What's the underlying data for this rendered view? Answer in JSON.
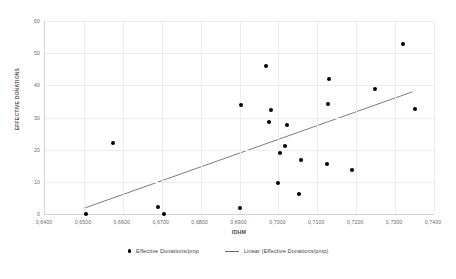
{
  "chart_data": {
    "type": "scatter",
    "title": "",
    "xlabel": "IDHM",
    "ylabel": "EFFECTIVE DONATIONS",
    "xlim": [
      0.64,
      0.74
    ],
    "ylim": [
      0,
      60
    ],
    "grid": true,
    "legend_position": "bottom",
    "x_tick_labels": [
      "0,6400",
      "0,6500",
      "0,6600",
      "0,6700",
      "0,6800",
      "0,6900",
      "0,7000",
      "0,7100",
      "0,7200",
      "0,7300",
      "0,7400"
    ],
    "x_tick_values": [
      0.64,
      0.65,
      0.66,
      0.67,
      0.68,
      0.69,
      0.7,
      0.71,
      0.72,
      0.73,
      0.74
    ],
    "y_tick_labels": [
      "0",
      "10",
      "20",
      "30",
      "40",
      "50",
      "60"
    ],
    "y_tick_values": [
      0,
      10,
      20,
      30,
      40,
      50,
      60
    ],
    "series": [
      {
        "name": "Effective Donations/pmp",
        "type": "scatter",
        "color": "#000000",
        "points": [
          {
            "x": 0.6505,
            "y": 0.0
          },
          {
            "x": 0.6575,
            "y": 22.0
          },
          {
            "x": 0.669,
            "y": 2.3
          },
          {
            "x": 0.6705,
            "y": 0.0
          },
          {
            "x": 0.69,
            "y": 1.8
          },
          {
            "x": 0.6903,
            "y": 34.0
          },
          {
            "x": 0.6968,
            "y": 46.0
          },
          {
            "x": 0.6975,
            "y": 28.7
          },
          {
            "x": 0.6982,
            "y": 32.3
          },
          {
            "x": 0.6998,
            "y": 9.6
          },
          {
            "x": 0.7005,
            "y": 18.9
          },
          {
            "x": 0.7018,
            "y": 21.0
          },
          {
            "x": 0.7022,
            "y": 27.7
          },
          {
            "x": 0.7053,
            "y": 6.2
          },
          {
            "x": 0.7057,
            "y": 16.7
          },
          {
            "x": 0.7125,
            "y": 15.4
          },
          {
            "x": 0.7127,
            "y": 34.2
          },
          {
            "x": 0.713,
            "y": 42.0
          },
          {
            "x": 0.7188,
            "y": 13.6
          },
          {
            "x": 0.7248,
            "y": 39.0
          },
          {
            "x": 0.732,
            "y": 53.0
          },
          {
            "x": 0.735,
            "y": 32.5
          }
        ]
      },
      {
        "name": "Linear (Effective Donations/pmp)",
        "type": "line",
        "color": "#6e6e6e",
        "endpoints": [
          {
            "x": 0.6503,
            "y": 1.9
          },
          {
            "x": 0.7345,
            "y": 38.0
          }
        ]
      }
    ]
  },
  "legend": {
    "entries": [
      {
        "label": "Effective Donations/pmp",
        "marker": "dot"
      },
      {
        "label": "Linear (Effective Donations/pmp)",
        "marker": "line"
      }
    ]
  }
}
